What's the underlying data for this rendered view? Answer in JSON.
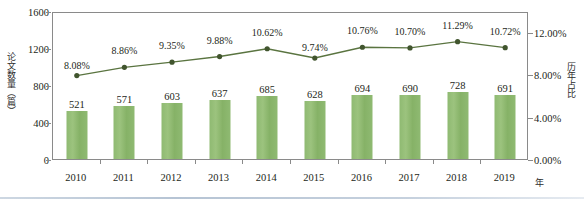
{
  "chart_data": {
    "type": "bar",
    "title": "",
    "subtitle": "",
    "xlabel": "年",
    "ylabel": "论文数量（篇）",
    "y2label": "历年占比",
    "categories": [
      "2010",
      "2011",
      "2012",
      "2013",
      "2014",
      "2015",
      "2016",
      "2017",
      "2018",
      "2019"
    ],
    "grid": false,
    "legend": "none",
    "ylim": [
      0,
      1600
    ],
    "yticks": [
      "0",
      "400",
      "800",
      "1200",
      "1600"
    ],
    "y2lim": [
      0,
      14
    ],
    "y2ticks": [
      "0.00%",
      "4.00%",
      "8.00%",
      "12.00%"
    ],
    "series": [
      {
        "name": "论文数量（篇）",
        "type": "bar",
        "axis": "left",
        "color": "#8fba72",
        "values": [
          521,
          571,
          603,
          637,
          685,
          628,
          694,
          690,
          728,
          691
        ],
        "value_labels": [
          "521",
          "571",
          "603",
          "637",
          "685",
          "628",
          "694",
          "690",
          "728",
          "691"
        ]
      },
      {
        "name": "历年占比",
        "type": "line",
        "axis": "right",
        "color": "#5a7440",
        "values": [
          8.08,
          8.86,
          9.35,
          9.88,
          10.62,
          9.74,
          10.76,
          10.7,
          11.29,
          10.72
        ],
        "value_labels": [
          "8.08%",
          "8.86%",
          "9.35%",
          "9.88%",
          "10.62%",
          "9.74%",
          "10.76%",
          "10.70%",
          "11.29%",
          "10.72%"
        ]
      }
    ]
  },
  "colors": {
    "bar": "#8fba72",
    "line": "#5a7440",
    "marker": "#41552e",
    "axis": "#8a8a8a",
    "text": "#231f20",
    "bottom_rule": "#b6c4d4"
  }
}
